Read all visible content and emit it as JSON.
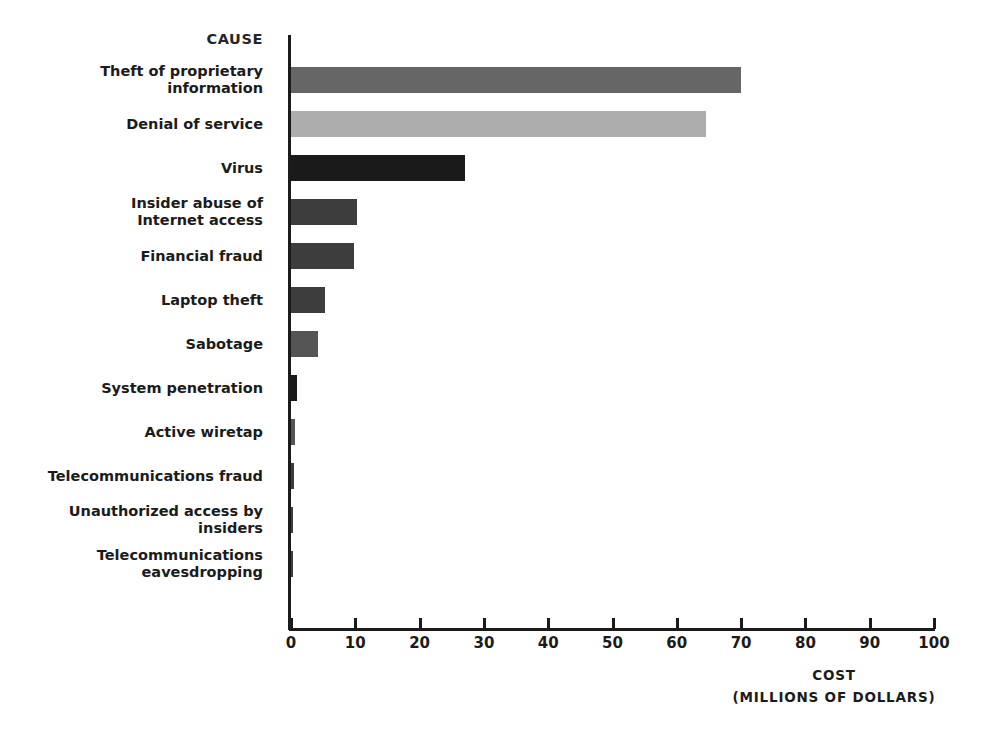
{
  "chart_data": {
    "type": "bar",
    "orientation": "horizontal",
    "title": "",
    "category_axis_header": "CAUSE",
    "xlabel_line1": "COST",
    "xlabel_line2": "(MILLIONS OF DOLLARS)",
    "ylabel": "CAUSE",
    "xlim": [
      0,
      100
    ],
    "xticks": [
      0,
      10,
      20,
      30,
      40,
      50,
      60,
      70,
      80,
      90,
      100
    ],
    "xtick_labels": [
      "0",
      "10",
      "20",
      "30",
      "40",
      "50",
      "60",
      "70",
      "80",
      "90",
      "100"
    ],
    "grid": false,
    "legend": "none",
    "categories": [
      "Theft of proprietary information",
      "Denial of service",
      "Virus",
      "Insider abuse of Internet access",
      "Financial fraud",
      "Laptop theft",
      "Sabotage",
      "System penetration",
      "Active wiretap",
      "Telecommunications fraud",
      "Unauthorized access by insiders",
      "Telecommunications eavesdropping"
    ],
    "values": [
      70.0,
      64.5,
      27.0,
      10.3,
      9.8,
      5.3,
      4.2,
      1.0,
      0.6,
      0.4,
      0.3,
      0.1
    ],
    "bar_colors": [
      "#666666",
      "#adadad",
      "#1a1a1a",
      "#3d3d3d",
      "#3d3d3d",
      "#3d3d3d",
      "#555555",
      "#1a1a1a",
      "#555555",
      "#3d3d3d",
      "#3d3d3d",
      "#3d3d3d"
    ],
    "rows": [
      {
        "label_lines": [
          "Theft of proprietary",
          "information"
        ],
        "value": 70.0,
        "color": "#666666"
      },
      {
        "label_lines": [
          "Denial of service"
        ],
        "value": 64.5,
        "color": "#adadad"
      },
      {
        "label_lines": [
          "Virus"
        ],
        "value": 27.0,
        "color": "#1a1a1a"
      },
      {
        "label_lines": [
          "Insider abuse of",
          "Internet access"
        ],
        "value": 10.3,
        "color": "#3d3d3d"
      },
      {
        "label_lines": [
          "Financial fraud"
        ],
        "value": 9.8,
        "color": "#3d3d3d"
      },
      {
        "label_lines": [
          "Laptop theft"
        ],
        "value": 5.3,
        "color": "#3d3d3d"
      },
      {
        "label_lines": [
          "Sabotage"
        ],
        "value": 4.2,
        "color": "#555555"
      },
      {
        "label_lines": [
          "System penetration"
        ],
        "value": 1.0,
        "color": "#1a1a1a"
      },
      {
        "label_lines": [
          "Active wiretap"
        ],
        "value": 0.6,
        "color": "#555555"
      },
      {
        "label_lines": [
          "Telecommunications fraud"
        ],
        "value": 0.4,
        "color": "#3d3d3d"
      },
      {
        "label_lines": [
          "Unauthorized access by",
          "insiders"
        ],
        "value": 0.3,
        "color": "#3d3d3d"
      },
      {
        "label_lines": [
          "Telecommunications",
          "eavesdropping"
        ],
        "value": 0.1,
        "color": "#3d3d3d"
      }
    ]
  }
}
